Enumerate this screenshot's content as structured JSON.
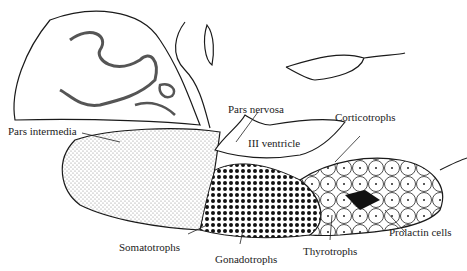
{
  "figure": {
    "labels": {
      "pars_intermedia": "Pars intermedia",
      "pars_nervosa": "Pars nervosa",
      "iii_ventricle": "III ventricle",
      "corticotrophs": "Corticotrophs",
      "somatotrophs": "Somatotrophs",
      "gonadotrophs": "Gonadotrophs",
      "thyrotrophs": "Thyrotrophs",
      "prolactin_cells": "Prolactin cells"
    },
    "colors": {
      "line": "#1a1a1a",
      "stipple": "#c8c8c8",
      "background": "#ffffff"
    }
  }
}
